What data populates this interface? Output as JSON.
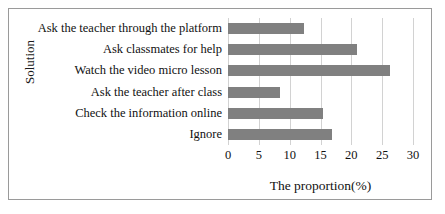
{
  "chart_data": {
    "type": "bar",
    "orientation": "horizontal",
    "title": "",
    "xlabel": "The proportion(%)",
    "ylabel": "Solution",
    "categories": [
      "Ask the teacher through the platform",
      "Ask classmates for help",
      "Watch the video micro lesson",
      "Ask the teacher after class",
      "Check the information online",
      "Ignore"
    ],
    "values": [
      12.3,
      20.9,
      26.3,
      8.4,
      15.4,
      16.8
    ],
    "xlim": [
      0,
      30
    ],
    "xticks": [
      0,
      5,
      10,
      15,
      20,
      25,
      30
    ],
    "xtick_labels": [
      "0",
      "5",
      "10",
      "15",
      "20",
      "25",
      "30"
    ],
    "grid": "vertical",
    "legend": "none",
    "bar_color": "#808080",
    "grid_color": "#d2d2d2",
    "axis_color": "#9a9a9a",
    "frame_color": "#9a9a9a",
    "background": "#ffffff"
  }
}
